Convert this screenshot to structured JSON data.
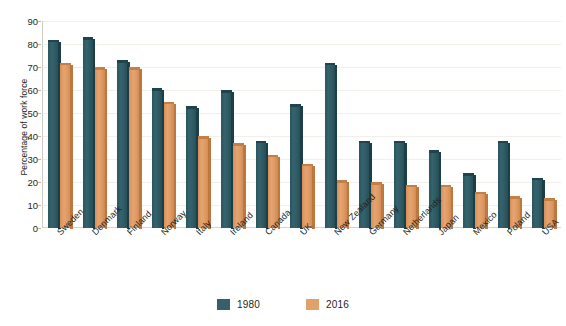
{
  "chart_data": {
    "type": "bar",
    "title": "",
    "subtitle": "",
    "xlabel": "",
    "ylabel": "Percentage of work force",
    "ylim": [
      0,
      90
    ],
    "ytick_step": 10,
    "yticks": [
      "90",
      "80",
      "70",
      "60",
      "50",
      "40",
      "30",
      "20",
      "10",
      "0"
    ],
    "grid": true,
    "legend_position": "bottom",
    "categories": [
      "Sweden",
      "Denmark",
      "Finland",
      "Norway",
      "Italy",
      "Ireland",
      "Canada",
      "UK",
      "New Zealand",
      "Germany",
      "Netherlands",
      "Japan",
      "Mexico",
      "Poland",
      "USA"
    ],
    "series": [
      {
        "name": "1980",
        "color": "#365f69",
        "values": [
          81,
          82,
          72,
          60,
          52,
          59,
          37,
          53,
          71,
          37,
          37,
          33,
          23,
          37,
          21
        ]
      },
      {
        "name": "2016",
        "color": "#e2a06a",
        "values": [
          71,
          69,
          69,
          54,
          39,
          36,
          31,
          27,
          20,
          19,
          18,
          18,
          15,
          13,
          12
        ]
      }
    ]
  },
  "legend": {
    "items": [
      {
        "label": "1980",
        "series_key": "s1980"
      },
      {
        "label": "2016",
        "series_key": "s2016"
      }
    ]
  }
}
